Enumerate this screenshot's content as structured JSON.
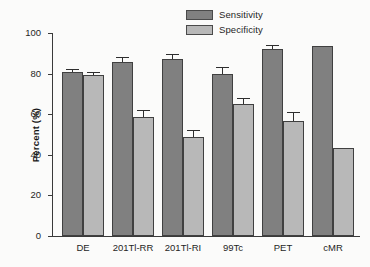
{
  "chart_data": {
    "type": "bar",
    "title": "",
    "xlabel": "",
    "ylabel": "Percent (%)",
    "ylim": [
      0,
      100
    ],
    "yticks": [
      0,
      20,
      40,
      60,
      80,
      100
    ],
    "grid": false,
    "legend_position": "top-center",
    "categories": [
      "DE",
      "201Tl-RR",
      "201Tl-RI",
      "99Tc",
      "PET",
      "cMR"
    ],
    "series": [
      {
        "name": "Sensitivity",
        "color": "#808080",
        "values": [
          81,
          85.5,
          87,
          80,
          92,
          93.5
        ],
        "errors": [
          1.0,
          2.0,
          2.0,
          3.0,
          1.5,
          0
        ]
      },
      {
        "name": "Specificity",
        "color": "#b8b8b8",
        "values": [
          79.5,
          58.5,
          49,
          65,
          56.5,
          43.5
        ],
        "errors": [
          1.0,
          3.0,
          2.5,
          2.5,
          4.0,
          0
        ]
      }
    ]
  },
  "legend": {
    "items": [
      {
        "label": "Sensitivity",
        "color": "#808080"
      },
      {
        "label": "Specificity",
        "color": "#b8b8b8"
      }
    ]
  },
  "axes": {
    "y_title": "Percent (%)",
    "y_tick_labels": [
      "0",
      "20",
      "40",
      "60",
      "80",
      "100"
    ],
    "x_tick_labels": [
      "DE",
      "201Tl-RR",
      "201Tl-RI",
      "99Tc",
      "PET",
      "cMR"
    ]
  }
}
